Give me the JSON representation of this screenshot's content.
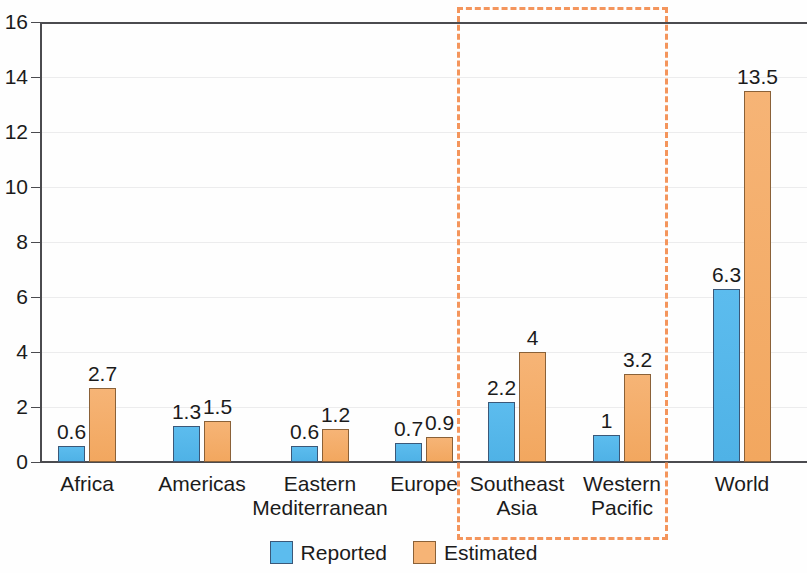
{
  "chart_data": {
    "type": "bar",
    "title": "",
    "subtitle": "",
    "xlabel": "",
    "ylabel": "",
    "ylim": [
      0,
      16
    ],
    "y_ticks": [
      0,
      2,
      4,
      6,
      8,
      10,
      12,
      14,
      16
    ],
    "y_tick_labels": [
      "0",
      "2",
      "4",
      "6",
      "8",
      "10",
      "12",
      "14",
      "16"
    ],
    "grid": true,
    "legend_position": "bottom-center",
    "categories": [
      "Africa",
      "Americas",
      "Eastern\nMediterranean",
      "Europe",
      "Southeast\nAsia",
      "Western\nPacific",
      "World"
    ],
    "series": [
      {
        "name": "Reported",
        "color": "#5cbcee",
        "values": [
          0.6,
          1.3,
          0.6,
          0.7,
          2.2,
          1,
          6.3
        ],
        "value_labels": [
          "0.6",
          "1.3",
          "0.6",
          "0.7",
          "2.2",
          "1",
          "6.3"
        ]
      },
      {
        "name": "Estimated",
        "color": "#f6b476",
        "values": [
          2.7,
          1.5,
          1.2,
          0.9,
          4,
          3.2,
          13.5
        ],
        "value_labels": [
          "2.7",
          "1.5",
          "1.2",
          "0.9",
          "4",
          "3.2",
          "13.5"
        ]
      }
    ],
    "annotations": [
      {
        "kind": "highlight-box",
        "style": "dashed",
        "color": "#f4955c",
        "covers": [
          "Southeast Asia",
          "Western Pacific"
        ]
      }
    ]
  },
  "legend": {
    "items": [
      {
        "label": "Reported",
        "swatch": "reported"
      },
      {
        "label": "Estimated",
        "swatch": "estimated"
      }
    ]
  }
}
